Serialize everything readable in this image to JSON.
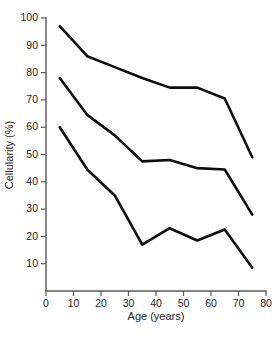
{
  "chart_data": {
    "type": "line",
    "title": "",
    "subtitle": "",
    "xlabel": "Age (years)",
    "ylabel": "Cellularity (%)",
    "xlim": [
      0,
      80
    ],
    "ylim": [
      0,
      100
    ],
    "xticks": [
      0,
      10,
      20,
      30,
      40,
      50,
      60,
      70,
      80
    ],
    "xtick_labels": [
      "0",
      "10",
      "20",
      "30",
      "40",
      "50",
      "60",
      "70",
      "80"
    ],
    "yticks": [
      10,
      20,
      30,
      40,
      50,
      60,
      70,
      80,
      90,
      100
    ],
    "ytick_labels": [
      "10",
      "20",
      "30",
      "40",
      "50",
      "60",
      "70",
      "80",
      "90",
      "100"
    ],
    "grid": false,
    "legend": null,
    "legend_position": "none",
    "line_color": "#0d0d0d",
    "axis_color": "#58585a",
    "background_color": "#ffffff",
    "x": [
      5,
      15,
      25,
      35,
      45,
      55,
      65,
      75
    ],
    "series": [
      {
        "name": "upper",
        "values": [
          97,
          86,
          82,
          78,
          74.5,
          74.5,
          70.5,
          49
        ]
      },
      {
        "name": "median",
        "values": [
          78,
          64.5,
          57,
          47.5,
          48,
          45,
          44.5,
          28
        ]
      },
      {
        "name": "lower",
        "values": [
          60,
          44.5,
          35,
          17,
          23,
          18.5,
          22.5,
          8.5
        ]
      }
    ],
    "annotations": []
  }
}
